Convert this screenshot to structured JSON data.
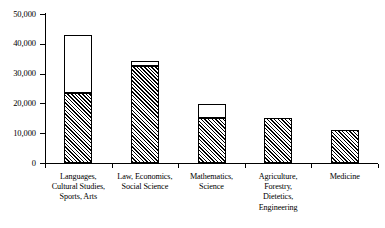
{
  "chart_data": {
    "type": "bar",
    "stacked": true,
    "title": "",
    "subtitle": "",
    "xlabel": "",
    "ylabel": "",
    "ylim": [
      0,
      50000
    ],
    "ytick_values": [
      0,
      10000,
      20000,
      30000,
      40000,
      50000
    ],
    "ytick_labels": [
      "0",
      "10,000",
      "20,000",
      "30,000",
      "40,000",
      "50,000"
    ],
    "grid": false,
    "legend": false,
    "legend_position": "none",
    "categories": [
      "Languages, Cultural Studies, Sports, Arts",
      "Law, Economics, Social Science",
      "Mathematics, Science",
      "Agriculture, Forestry, Dietetics, Engineering",
      "Medicine"
    ],
    "category_label_lines": [
      [
        "Languages,",
        "Cultural Studies,",
        "Sports, Arts"
      ],
      [
        "Law, Economics,",
        "Social Science"
      ],
      [
        "Mathematics,",
        "Science"
      ],
      [
        "Agriculture,",
        "Forestry,",
        "Dietetics,",
        "Engineering"
      ],
      [
        "Medicine"
      ]
    ],
    "series": [
      {
        "name": "hatched-segment",
        "fill": "diagonal-hatch",
        "values": [
          23500,
          32500,
          15100,
          15100,
          11100
        ]
      },
      {
        "name": "white-segment",
        "fill": "white",
        "values": [
          19500,
          1700,
          4700,
          0,
          0
        ]
      }
    ],
    "totals": [
      43000,
      34200,
      19800,
      15100,
      11100
    ]
  },
  "style": {
    "axis_color": "#000000",
    "hatch_color": "#000000",
    "bar_fill_white": "#ffffff",
    "background": "#ffffff"
  }
}
